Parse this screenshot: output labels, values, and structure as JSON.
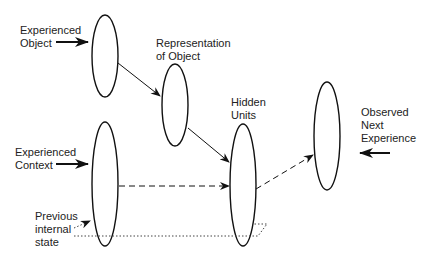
{
  "labels": {
    "experienced_object": "Experienced\nObject",
    "representation": "Representation\nof Object",
    "hidden_units": "Hidden\nUnits",
    "observed_next": "Observed\nNext\nExperience",
    "experienced_context": "Experienced\nContext",
    "previous_state": "Previous\ninternal\nstate"
  },
  "colors": {
    "stroke": "#111111",
    "text": "#222222",
    "dotted": "#444444"
  }
}
